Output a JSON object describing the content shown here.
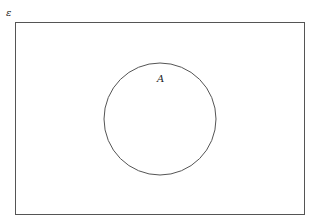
{
  "diagram": {
    "type": "venn",
    "universal_set_label": "ε",
    "sets": [
      {
        "label": "A"
      }
    ],
    "colors": {
      "stroke": "#555555",
      "background": "#ffffff"
    }
  }
}
